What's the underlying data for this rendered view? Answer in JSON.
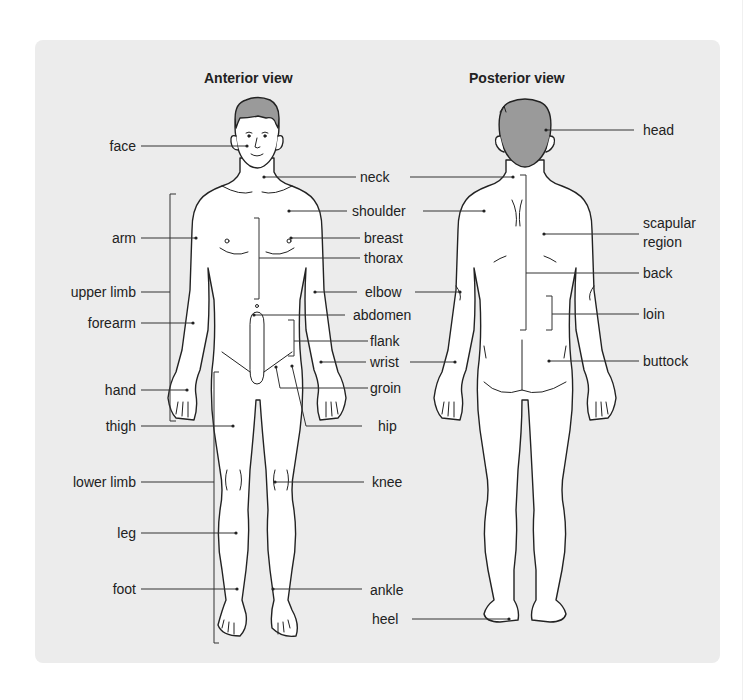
{
  "titles": {
    "anterior": "Anterior view",
    "posterior": "Posterior view"
  },
  "labels": {
    "left": {
      "face": "face",
      "arm": "arm",
      "upper_limb": "upper limb",
      "forearm": "forearm",
      "hand": "hand",
      "thigh": "thigh",
      "lower_limb": "lower limb",
      "leg": "leg",
      "foot": "foot"
    },
    "middle": {
      "neck": "neck",
      "shoulder": "shoulder",
      "breast": "breast",
      "thorax": "thorax",
      "elbow": "elbow",
      "abdomen": "abdomen",
      "flank": "flank",
      "wrist": "wrist",
      "groin": "groin",
      "hip": "hip",
      "knee": "knee",
      "ankle": "ankle",
      "heel": "heel"
    },
    "right": {
      "head": "head",
      "scapular_line1": "scapular",
      "scapular_line2": "region",
      "back": "back",
      "loin": "loin",
      "buttock": "buttock"
    }
  },
  "colors": {
    "panel": "#ececec",
    "hair": "#9a9a9a",
    "skin": "#ffffff",
    "line": "#222222"
  }
}
